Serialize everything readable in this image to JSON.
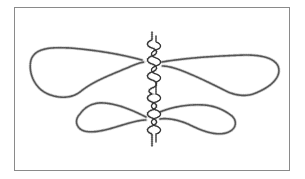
{
  "figure": {
    "kind": "line-illustration",
    "frame_color": "#8a8a8a",
    "stroke_color": "#555555",
    "background": "#ffffff"
  },
  "elements": {
    "central_axis": {
      "label": "",
      "coils": 14
    },
    "loops": [
      {
        "id": "upper-left",
        "label": ""
      },
      {
        "id": "upper-right",
        "label": ""
      },
      {
        "id": "lower-left",
        "label": ""
      },
      {
        "id": "lower-right",
        "label": ""
      }
    ]
  }
}
